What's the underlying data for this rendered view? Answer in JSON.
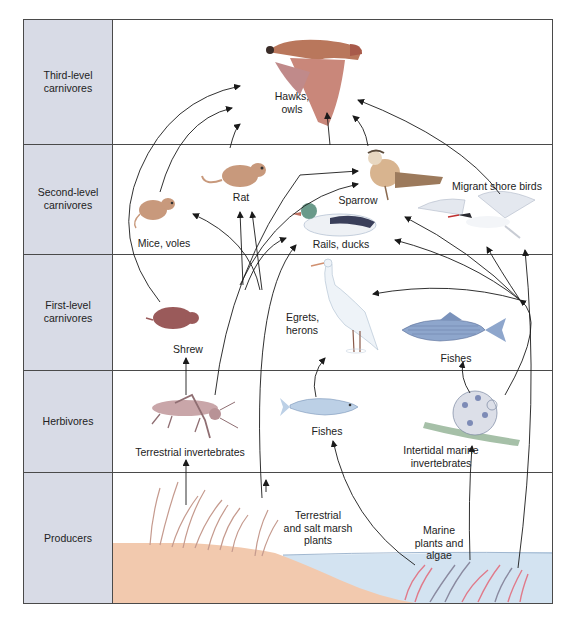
{
  "diagram": {
    "type": "food web",
    "levels": [
      {
        "id": "third",
        "label_line1": "Third-level",
        "label_line2": "carnivores"
      },
      {
        "id": "second",
        "label_line1": "Second-level",
        "label_line2": "carnivores"
      },
      {
        "id": "first",
        "label_line1": "First-level",
        "label_line2": "carnivores"
      },
      {
        "id": "herb",
        "label_line1": "Herbivores",
        "label_line2": ""
      },
      {
        "id": "prod",
        "label_line1": "Producers",
        "label_line2": ""
      }
    ],
    "organisms": {
      "hawks_l1": "Hawks,",
      "hawks_l2": "owls",
      "rat": "Rat",
      "mice": "Mice, voles",
      "sparrow": "Sparrow",
      "rails": "Rails, ducks",
      "shorebirds": "Migrant shore birds",
      "shrew": "Shrew",
      "egrets_l1": "Egrets,",
      "egrets_l2": "herons",
      "fishes_first": "Fishes",
      "terr_inv": "Terrestrial invertebrates",
      "fishes_herb": "Fishes",
      "marine_inv_l1": "Intertidal marine",
      "marine_inv_l2": "invertebrates",
      "terr_plants_l1": "Terrestrial",
      "terr_plants_l2": "and salt marsh",
      "terr_plants_l3": "plants",
      "marine_plants_l1": "Marine",
      "marine_plants_l2": "plants and",
      "marine_plants_l3": "algae"
    },
    "colors": {
      "side_panel": "#d8dbe6",
      "sand": "#f2c9ae",
      "water": "#d3e3f1",
      "grid": "#4a4a4a",
      "arrow": "#1a1a1a"
    }
  }
}
